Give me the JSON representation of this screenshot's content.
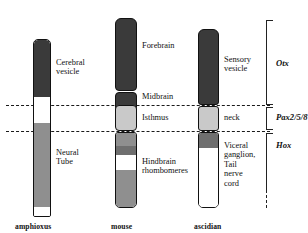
{
  "figure": {
    "type": "comparative-neural-tube-diagram",
    "width": 308,
    "height": 233,
    "background": "#ffffff"
  },
  "palette": {
    "dark": "#3a3a3a",
    "mid_dark": "#6f6f6f",
    "mid": "#8f8f8f",
    "light": "#c9c9c9",
    "lighter": "#d8d8d8",
    "white": "#ffffff",
    "outline": "#111111",
    "dashed": "#1a1a1a"
  },
  "columns": [
    {
      "id": "amphioxus",
      "species_label": "amphioxus",
      "segments": [
        {
          "name": "cerebral-vesicle",
          "color": "#3a3a3a",
          "top": 0,
          "height": 57
        },
        {
          "name": "anterior-gap",
          "color": "#ffffff",
          "top": 57,
          "height": 26
        },
        {
          "name": "neural-tube",
          "color": "#8f8f8f",
          "top": 83,
          "height": 84
        },
        {
          "name": "posterior-tip",
          "color": "#ffffff",
          "top": 167,
          "height": 9
        }
      ],
      "callouts": [
        {
          "name": "cerebral-vesicle-label",
          "text": "Cerebral\nvesicle"
        },
        {
          "name": "neural-tube-label",
          "text": "Neural Tube"
        }
      ]
    },
    {
      "id": "mouse",
      "species_label": "mouse",
      "segments": [
        {
          "name": "forebrain",
          "color": "#3a3a3a",
          "top": 0,
          "height": 73
        },
        {
          "name": "midbrain",
          "color": "#3a3a3a",
          "top": 76,
          "height": 28
        },
        {
          "name": "isthmus",
          "color": "#c9c9c9",
          "top": 107,
          "height": 24
        },
        {
          "name": "hindbrain-r1",
          "color": "#8f8f8f",
          "top": 134,
          "height": 12
        },
        {
          "name": "hindbrain-r2",
          "color": "#6f6f6f",
          "top": 146,
          "height": 8
        },
        {
          "name": "hindbrain-r3",
          "color": "#ffffff",
          "top": 154,
          "height": 14
        },
        {
          "name": "hindbrain-r4",
          "color": "#8f8f8f",
          "top": 168,
          "height": 22
        }
      ],
      "callouts": [
        {
          "name": "forebrain-label",
          "text": "Forebrain"
        },
        {
          "name": "midbrain-label",
          "text": "Midbrain"
        },
        {
          "name": "isthmus-label",
          "text": "Isthmus"
        },
        {
          "name": "hindbrain-label",
          "text": "Hindbrain\nrhombomeres"
        }
      ]
    },
    {
      "id": "ascidian",
      "species_label": "ascidian",
      "segments": [
        {
          "name": "sensory-vesicle",
          "color": "#3a3a3a",
          "top": 0,
          "height": 76
        },
        {
          "name": "neck",
          "color": "#c9c9c9",
          "top": 79,
          "height": 24
        },
        {
          "name": "visceral-dark",
          "color": "#6f6f6f",
          "top": 106,
          "height": 14
        },
        {
          "name": "tail-nerve-cord",
          "color": "#ffffff",
          "top": 120,
          "height": 57
        }
      ],
      "callouts": [
        {
          "name": "sensory-vesicle-label",
          "text": "Sensory\nvesicle"
        },
        {
          "name": "neck-label",
          "text": "neck"
        },
        {
          "name": "visceral-ganglion-label",
          "text": "Viceral\nganglion,\nTail nerve\ncord"
        }
      ]
    }
  ],
  "gene_domains": [
    {
      "id": "otx",
      "label": "Otx",
      "top": 20,
      "bottom": 104
    },
    {
      "id": "pax",
      "label": "Pax2/5/8",
      "top": 107,
      "bottom": 130
    },
    {
      "id": "hox",
      "label": "Hox",
      "top": 133,
      "bottom": 190
    }
  ],
  "separator_lines": [
    {
      "name": "otx-pax-boundary",
      "y": 105
    },
    {
      "name": "pax-hox-boundary",
      "y": 131
    }
  ]
}
